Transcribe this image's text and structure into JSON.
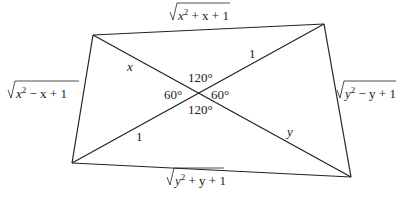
{
  "diagram": {
    "type": "quadrilateral-with-diagonals",
    "vertices": {
      "top_left": [
        93,
        35
      ],
      "top_right": [
        324,
        24
      ],
      "bottom_right": [
        351,
        177
      ],
      "bottom_left": [
        72,
        163
      ]
    },
    "center": [
      198,
      94
    ],
    "line_color": "#222222",
    "side_labels": {
      "top": {
        "radicand_var": "x",
        "sup": "2",
        "rest": " + x + 1"
      },
      "left": {
        "radicand_var": "x",
        "sup": "2",
        "rest": " − x + 1"
      },
      "right": {
        "radicand_var": "y",
        "sup": "2",
        "rest": " − y + 1"
      },
      "bottom": {
        "radicand_var": "y",
        "sup": "2",
        "rest": " + y + 1"
      }
    },
    "segment_labels": {
      "upper_left": "x",
      "upper_right": "1",
      "lower_left": "1",
      "lower_right": "y"
    },
    "angle_labels": {
      "top": "120°",
      "bottom": "120°",
      "left": "60°",
      "right": "60°"
    }
  }
}
